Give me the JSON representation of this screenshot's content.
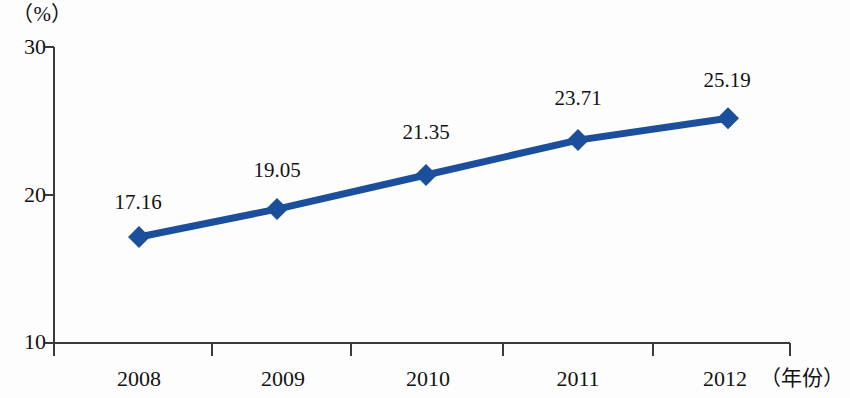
{
  "chart_data": {
    "type": "line",
    "title": "",
    "subtitle": "",
    "xlabel": "（年份）",
    "ylabel": "（%）",
    "categories": [
      "2008",
      "2009",
      "2010",
      "2011",
      "2012"
    ],
    "values": [
      17.16,
      19.05,
      21.35,
      23.71,
      25.19
    ],
    "point_labels": [
      "17.16",
      "19.05",
      "21.35",
      "23.71",
      "25.19"
    ],
    "series": [
      {
        "name": "",
        "values": [
          17.16,
          19.05,
          21.35,
          23.71,
          25.19
        ],
        "color": "#1b4e9b",
        "marker": "diamond"
      }
    ],
    "ylim": [
      10,
      30
    ],
    "yticks": [
      10,
      20,
      30
    ],
    "ytick_labels": [
      "10",
      "20",
      "30"
    ],
    "grid": false,
    "legend": false,
    "legend_position": "none",
    "axis_color": "#3a3a3a",
    "line_color": "#1b4e9b",
    "marker_color": "#1b4e9b",
    "text_color": "#121212",
    "background": "#ffffff"
  }
}
